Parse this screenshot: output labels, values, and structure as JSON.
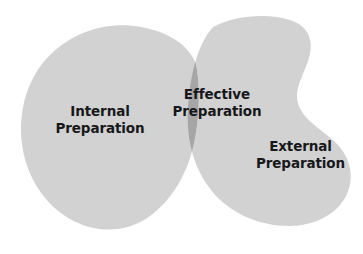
{
  "diagram": {
    "type": "venn-2-set-overlap",
    "background_color": "#ffffff",
    "set_fill_color": "#d2d2d2",
    "overlap_fill_color": "#a6a6a6",
    "text_color": "#17181a",
    "sets": [
      {
        "id": "internal",
        "label_line1": "Internal",
        "label_line2": "Preparation",
        "position": "left",
        "fill": "#d2d2d2"
      },
      {
        "id": "external",
        "label_line1": "External",
        "label_line2": "Preparation",
        "position": "right",
        "fill": "#d2d2d2"
      }
    ],
    "intersection": {
      "id": "effective",
      "label_line1": "Effective",
      "label_line2": "Preparation",
      "position": "center",
      "fill": "#a6a6a6"
    }
  }
}
